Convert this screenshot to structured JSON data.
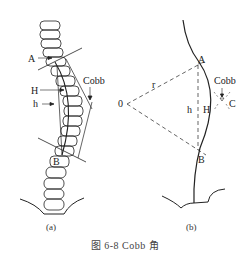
{
  "figure": {
    "caption": "图 6-8   Cobb 角",
    "panel_a": {
      "sublabel": "(a)",
      "labels": {
        "A": "A",
        "H": "H",
        "h": "h",
        "B": "B",
        "cobb": "Cobb"
      }
    },
    "panel_b": {
      "sublabel": "(b)",
      "labels": {
        "A": "A",
        "H": "H",
        "h": "h",
        "B": "B",
        "C": "C",
        "r": "r",
        "O": "0",
        "cobb": "Cobb"
      }
    },
    "colors": {
      "line": "#222222",
      "background": "#ffffff"
    }
  }
}
